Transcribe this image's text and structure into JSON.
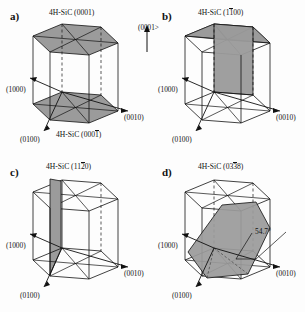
{
  "figure": {
    "type": "crystallographic-orientation-diagram",
    "material": "4H-SiC",
    "background_color": "#fdfdfd",
    "line_color": "#111111",
    "plane_fill_color": "#9a9a9a",
    "plane_fill_light": "#b0b0b0"
  },
  "panels": [
    {
      "id": "a",
      "letter": "a)",
      "plane_label_top": "4H-SiC (0001)",
      "plane_label_bottom_prefix": "4H-SiC (000",
      "plane_label_bottom_overbar": "1",
      "plane_label_bottom_suffix": ")",
      "axis_a1": "(1000)",
      "axis_a2": "(0010)",
      "axis_a3": "(0100)",
      "shaded_planes": [
        "top basal plane",
        "bottom basal plane"
      ]
    },
    {
      "id": "b",
      "letter": "b)",
      "plane_label_prefix": "4H-SiC (1",
      "plane_label_overbar": "1",
      "plane_label_suffix": "00)",
      "caxis_label": "(0001>",
      "axis_a1": "(1000)",
      "axis_a2": "(0010)",
      "axis_a3": "(0100)",
      "shaded_planes": [
        "vertical m-plane"
      ]
    },
    {
      "id": "c",
      "letter": "c)",
      "plane_label_prefix": "4H-SiC (11",
      "plane_label_overbar": "2",
      "plane_label_suffix": "0)",
      "axis_a1": "(1000)",
      "axis_a2": "(0010)",
      "axis_a3": "(0100)",
      "shaded_planes": [
        "vertical a-plane"
      ]
    },
    {
      "id": "d",
      "letter": "d)",
      "plane_label_prefix": "4H-SiC (03",
      "plane_label_overbar": "3",
      "plane_label_suffix": "8)",
      "angle_label": "54.7°",
      "axis_a1": "(1000)",
      "axis_a2": "(0010)",
      "axis_a3": "(0100)",
      "shaded_planes": [
        "inclined semipolar plane"
      ]
    }
  ]
}
